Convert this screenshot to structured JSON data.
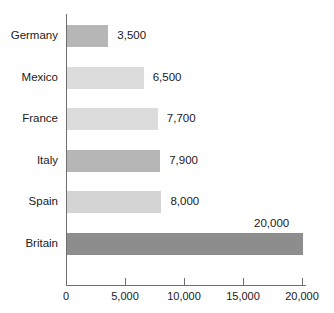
{
  "chart_data": {
    "type": "bar",
    "orientation": "horizontal",
    "title": "",
    "subtitle": "",
    "xlabel": "",
    "ylabel": "",
    "categories": [
      "Germany",
      "Mexico",
      "France",
      "Italy",
      "Spain",
      "Britain"
    ],
    "values": [
      3500,
      6500,
      7700,
      7900,
      8000,
      20000
    ],
    "value_labels": [
      "3,500",
      "6,500",
      "7,700",
      "7,900",
      "8,000",
      "20,000"
    ],
    "bar_colors": [
      "#b6b6b6",
      "#dcdcdc",
      "#dcdcdc",
      "#b6b6b6",
      "#d4d4d4",
      "#8d8d8d"
    ],
    "xlim": [
      0,
      20000
    ],
    "xticks": [
      0,
      5000,
      10000,
      15000,
      20000
    ],
    "xtick_labels": [
      "0",
      "5,000",
      "10,000",
      "15,000",
      "20,000"
    ],
    "grid": false,
    "legend": false,
    "axis_color": "#6e6e6e",
    "background_color": "#ffffff",
    "label_positions": [
      "right",
      "right",
      "right",
      "right",
      "right",
      "above"
    ]
  }
}
